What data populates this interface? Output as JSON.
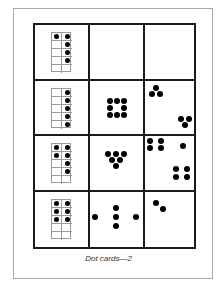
{
  "caption": "Dot cards—2",
  "colors": {
    "grid_line": "#1a1a1a",
    "frame_border": "#a8a8a8",
    "dot": "#000000",
    "tenframe_line": "#9a9a9a"
  },
  "rows": [
    {
      "ten_frame": {
        "filled": [
          [
            0,
            0
          ],
          [
            0,
            1
          ],
          [
            1,
            1
          ],
          [
            2,
            1
          ],
          [
            3,
            1
          ]
        ],
        "count": 5
      },
      "card_a": {
        "pattern": "blank",
        "count": 0,
        "dots": []
      },
      "card_b": {
        "pattern": "blank",
        "count": 0,
        "dots": []
      }
    },
    {
      "ten_frame": {
        "filled": [
          [
            0,
            1
          ],
          [
            1,
            1
          ],
          [
            2,
            1
          ],
          [
            3,
            1
          ],
          [
            4,
            1
          ]
        ],
        "count": 5
      },
      "card_a": {
        "pattern": "square-ring",
        "count": 8,
        "dots": [
          [
            20,
            20
          ],
          [
            27,
            20
          ],
          [
            34,
            20
          ],
          [
            20,
            27
          ],
          [
            34,
            27
          ],
          [
            20,
            34
          ],
          [
            27,
            34
          ],
          [
            34,
            34
          ]
        ]
      },
      "card_b": {
        "pattern": "two-triangles",
        "count": 6,
        "dots": [
          [
            11,
            7
          ],
          [
            7,
            13
          ],
          [
            15,
            13
          ],
          [
            36,
            38
          ],
          [
            44,
            38
          ],
          [
            40,
            44
          ]
        ]
      }
    },
    {
      "ten_frame": {
        "filled": [
          [
            0,
            0
          ],
          [
            0,
            1
          ],
          [
            1,
            0
          ],
          [
            1,
            1
          ],
          [
            2,
            1
          ],
          [
            3,
            1
          ]
        ],
        "count": 6
      },
      "card_a": {
        "pattern": "inverted-triangle",
        "count": 6,
        "dots": [
          [
            18,
            18
          ],
          [
            26,
            18
          ],
          [
            34,
            18
          ],
          [
            22,
            24
          ],
          [
            30,
            24
          ],
          [
            26,
            30
          ]
        ]
      },
      "card_b": {
        "pattern": "four-one-four",
        "count": 9,
        "dots": [
          [
            5,
            5
          ],
          [
            16,
            5
          ],
          [
            5,
            12
          ],
          [
            16,
            12
          ],
          [
            38,
            10
          ],
          [
            31,
            33
          ],
          [
            42,
            33
          ],
          [
            31,
            41
          ],
          [
            42,
            41
          ]
        ]
      }
    },
    {
      "ten_frame": {
        "filled": [
          [
            0,
            0
          ],
          [
            0,
            1
          ],
          [
            1,
            0
          ],
          [
            1,
            1
          ],
          [
            2,
            0
          ],
          [
            2,
            1
          ]
        ],
        "count": 6
      },
      "card_a": {
        "pattern": "cross-line",
        "count": 5,
        "dots": [
          [
            5,
            25
          ],
          [
            26,
            16
          ],
          [
            26,
            25
          ],
          [
            26,
            34
          ],
          [
            46,
            25
          ]
        ]
      },
      "card_b": {
        "pattern": "diagonal-pair",
        "count": 2,
        "dots": [
          [
            11,
            11
          ],
          [
            18,
            17
          ]
        ]
      }
    }
  ]
}
